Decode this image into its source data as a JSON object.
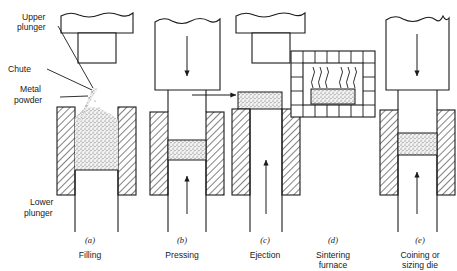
{
  "figure": {
    "title_alt": "Powder metallurgy process sequence",
    "line_color": "#1a1a1a",
    "powder_color": "#e9e9e9",
    "background": "#ffffff"
  },
  "labels": {
    "upper_plunger": "Upper",
    "upper_plunger2": "plunger",
    "chute": "Chute",
    "metal_powder": "Metal",
    "metal_powder2": "powder",
    "lower_plunger": "Lower",
    "lower_plunger2": "plunger"
  },
  "panels": [
    {
      "key": "a",
      "letter": "(a)",
      "caption": "Filling",
      "caption2": "",
      "cx": 90,
      "arrow_up": false,
      "arrow_down": false
    },
    {
      "key": "b",
      "letter": "(b)",
      "caption": "Pressing",
      "caption2": "",
      "cx": 182,
      "arrow_up": true,
      "arrow_down": true
    },
    {
      "key": "c",
      "letter": "(c)",
      "caption": "Ejection",
      "caption2": "",
      "cx": 265,
      "arrow_up": true,
      "arrow_down": false
    },
    {
      "key": "d",
      "letter": "(d)",
      "caption": "Sintering",
      "caption2": "furnace",
      "cx": 333,
      "arrow_up": false,
      "arrow_down": false
    },
    {
      "key": "e",
      "letter": "(e)",
      "caption": "Coining or",
      "caption2": "sizing die",
      "cx": 420,
      "arrow_up": true,
      "arrow_down": true
    }
  ],
  "icons": {
    "down_arrow": "arrow-down-icon",
    "up_arrow": "arrow-up-icon",
    "transfer_arrow": "arrow-right-icon",
    "heat_waves": "heat-wave-icon",
    "powder_stream": "powder-stream-icon"
  }
}
